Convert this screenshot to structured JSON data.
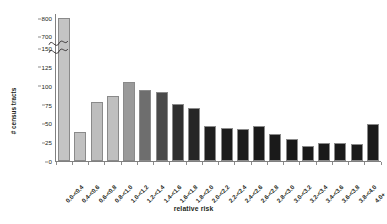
{
  "chart_data": {
    "type": "bar",
    "title": "",
    "xlabel": "relative risk",
    "ylabel": "# census tracts",
    "categories": [
      "0.0-<0.4",
      "0.4-<0.6",
      "0.6-<0.8",
      "0.8-<1.0",
      "1.0-<1.2",
      "1.2-<1.4",
      "1.4-<1.6",
      "1.6-<1.8",
      "1.8-<2.0",
      "2.0-<2.2",
      "2.2-<2.4",
      "2.4-<2.6",
      "2.6-<2.8",
      "2.8-<3.0",
      "3.0-<3.2",
      "3.2-<3.4",
      "3.4-<3.6",
      "3.6-<3.8",
      "3.8-<4.0",
      "4.0+"
    ],
    "values": [
      790,
      36,
      76,
      84,
      102,
      92,
      89,
      73,
      68,
      44,
      41,
      40,
      44,
      33,
      27,
      17,
      21,
      21,
      20,
      46
    ],
    "bar_colors": [
      "#c4c4c4",
      "#c0c0c0",
      "#bdbdbd",
      "#bfbfbf",
      "#9a9a9a",
      "#6e6e6e",
      "#4a4a4a",
      "#2f2f2f",
      "#262626",
      "#1f1f1f",
      "#1c1c1c",
      "#1c1c1c",
      "#1a1a1a",
      "#1a1a1a",
      "#1a1a1a",
      "#1a1a1a",
      "#1a1a1a",
      "#1a1a1a",
      "#1a1a1a",
      "#1a1a1a"
    ],
    "ytick_labels": [
      "800",
      "700",
      "150",
      "125",
      "100",
      "75",
      "50",
      "25",
      "0"
    ],
    "ytick_values": [
      800,
      700,
      150,
      125,
      100,
      75,
      50,
      25,
      0
    ],
    "axis_break": {
      "present": true,
      "between": [
        700,
        150
      ],
      "style": "squiggle"
    },
    "ylim_lower_segment": [
      0,
      150
    ],
    "ylim_upper_segment": [
      700,
      800
    ],
    "grid": false,
    "legend": "none"
  },
  "axes": {
    "y_title": "# census tracts",
    "x_title": "relative risk"
  }
}
